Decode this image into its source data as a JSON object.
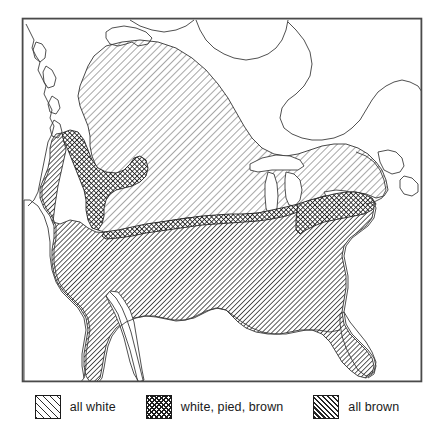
{
  "figure": {
    "kind": "distribution-map",
    "region": "North America",
    "frame": {
      "x": 22,
      "y": 18,
      "width": 400,
      "height": 364,
      "stroke": "#4a4a4a"
    }
  },
  "legend": {
    "entries": [
      {
        "label": "all white",
        "pattern": "diagonal-hatch-sparse",
        "swatch_name": "legend-swatch-all-white"
      },
      {
        "label": "white, pied, brown",
        "pattern": "cross-hatch-dense",
        "swatch_name": "legend-swatch-white-pied-brown"
      },
      {
        "label": "all brown",
        "pattern": "diagonal-hatch-dense",
        "swatch_name": "legend-swatch-all-brown"
      }
    ]
  },
  "colors": {
    "ink": "#1b1b1b",
    "coastline": "#3c3c3c",
    "frame": "#4a4a4a",
    "background": "#ffffff"
  },
  "map_zones": [
    {
      "name": "all-white-zone",
      "description": "Northern zone covering central and western Canada extending to the Great Lakes and New England"
    },
    {
      "name": "white-pied-brown-zone",
      "description": "Narrow transitional band along the northern Rocky Mountains, upper Midwest and into the northeast"
    },
    {
      "name": "all-brown-zone",
      "description": "Southern zone covering the contiguous United States and northern Mexico"
    }
  ]
}
